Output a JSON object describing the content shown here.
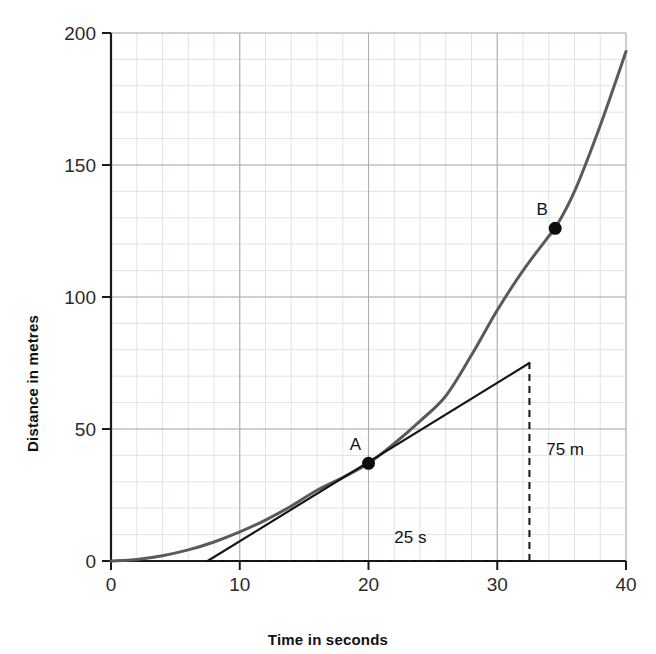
{
  "chart_data": {
    "type": "line",
    "title": "",
    "xlabel": "Time in seconds",
    "ylabel": "Distance in metres",
    "xlim": [
      0,
      40
    ],
    "ylim": [
      0,
      200
    ],
    "xticks": [
      0,
      10,
      20,
      30,
      40
    ],
    "yticks": [
      0,
      50,
      100,
      150,
      200
    ],
    "xtick_labels": [
      "0",
      "10",
      "20",
      "30",
      "40"
    ],
    "ytick_labels": [
      "0",
      "50",
      "100",
      "150",
      "200"
    ],
    "grid": true,
    "grid_major_x": 10,
    "grid_major_y": 50,
    "grid_minor_x": 2,
    "grid_minor_y": 10,
    "legend": "none",
    "series": [
      {
        "name": "distance-time curve",
        "kind": "curve",
        "color": "#5a5a5a",
        "x": [
          0,
          2,
          4,
          6,
          8,
          10,
          12,
          14,
          16,
          18,
          20,
          22,
          24,
          26,
          28,
          30,
          32,
          34,
          34.5,
          36,
          38,
          40
        ],
        "y": [
          0,
          0.6,
          2.0,
          4.2,
          7.2,
          11.0,
          15.5,
          20.8,
          26.8,
          31.6,
          37.0,
          44.5,
          53.0,
          62.5,
          78.0,
          95.0,
          110.0,
          123.0,
          126.0,
          140.0,
          165.0,
          193.0
        ]
      },
      {
        "name": "tangent at A",
        "kind": "line",
        "color": "#151515",
        "x": [
          7.5,
          32.5
        ],
        "y": [
          0,
          75
        ]
      }
    ],
    "points": [
      {
        "label": "A",
        "x": 20,
        "y": 37
      },
      {
        "label": "B",
        "x": 34.5,
        "y": 126
      }
    ],
    "annotations": [
      {
        "name": "rise-label",
        "text": "75 m",
        "x": 33.8,
        "y": 40
      },
      {
        "name": "run-label",
        "text": "25 s",
        "x": 22.0,
        "y": 7
      }
    ],
    "guides": [
      {
        "name": "run-guide",
        "style": "dashed",
        "from": [
          7.5,
          0
        ],
        "to": [
          32.5,
          0
        ]
      },
      {
        "name": "rise-guide",
        "style": "dashed",
        "from": [
          32.5,
          0
        ],
        "to": [
          32.5,
          75
        ]
      }
    ]
  }
}
